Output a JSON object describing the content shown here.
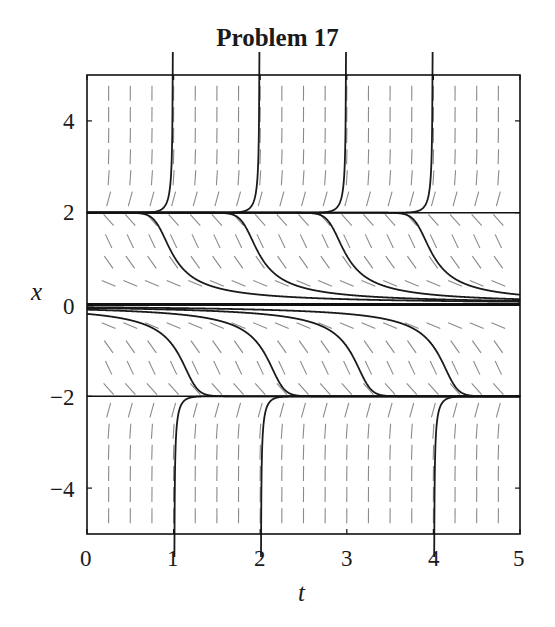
{
  "chart_data": {
    "type": "line",
    "title": "Problem 17",
    "xlabel": "t",
    "ylabel": "x",
    "xlim": [
      0,
      5
    ],
    "ylim": [
      -5,
      5
    ],
    "xticks": [
      0,
      1,
      2,
      3,
      4,
      5
    ],
    "yticks": [
      -4,
      -2,
      0,
      2,
      4
    ],
    "grid": false,
    "legend": null,
    "slope_field": {
      "equation": "dx/dt = x^2 (x^2 - 4)",
      "t_start": 0.25,
      "t_step": 0.25,
      "t_count": 20,
      "x_start": -4.6,
      "x_step": 0.46,
      "x_count": 21,
      "color": "#8a8a8a"
    },
    "equilibria": [
      2,
      0,
      -2
    ],
    "series": [
      {
        "name": "blowup-1",
        "points": [
          [
            0.0,
            2.0
          ],
          [
            0.5,
            2.01
          ],
          [
            0.8,
            2.1
          ],
          [
            0.95,
            2.6
          ],
          [
            1.0,
            5.0
          ]
        ]
      },
      {
        "name": "blowup-2",
        "points": [
          [
            1.0,
            2.0
          ],
          [
            1.5,
            2.01
          ],
          [
            1.8,
            2.1
          ],
          [
            1.95,
            2.6
          ],
          [
            2.0,
            5.0
          ]
        ]
      },
      {
        "name": "blowup-3",
        "points": [
          [
            2.0,
            2.0
          ],
          [
            2.5,
            2.01
          ],
          [
            2.8,
            2.1
          ],
          [
            2.95,
            2.6
          ],
          [
            3.0,
            5.0
          ]
        ]
      },
      {
        "name": "blowup-4",
        "points": [
          [
            3.0,
            2.0
          ],
          [
            3.5,
            2.01
          ],
          [
            3.8,
            2.1
          ],
          [
            3.95,
            2.6
          ],
          [
            4.0,
            5.0
          ]
        ]
      },
      {
        "name": "upper-1",
        "points": [
          [
            0.5,
            2.0
          ],
          [
            0.7,
            1.9
          ],
          [
            0.9,
            1.3
          ],
          [
            1.1,
            0.8
          ],
          [
            1.5,
            0.5
          ],
          [
            2.5,
            0.3
          ],
          [
            5.0,
            0.15
          ]
        ]
      },
      {
        "name": "upper-2",
        "points": [
          [
            1.5,
            2.0
          ],
          [
            1.7,
            1.9
          ],
          [
            1.9,
            1.3
          ],
          [
            2.1,
            0.8
          ],
          [
            2.5,
            0.5
          ],
          [
            3.5,
            0.3
          ],
          [
            5.0,
            0.18
          ]
        ]
      },
      {
        "name": "upper-3",
        "points": [
          [
            2.5,
            2.0
          ],
          [
            2.7,
            1.9
          ],
          [
            2.9,
            1.3
          ],
          [
            3.1,
            0.8
          ],
          [
            3.5,
            0.5
          ],
          [
            4.5,
            0.3
          ],
          [
            5.0,
            0.25
          ]
        ]
      },
      {
        "name": "upper-4",
        "points": [
          [
            3.5,
            2.0
          ],
          [
            3.7,
            1.9
          ],
          [
            3.9,
            1.3
          ],
          [
            4.1,
            0.8
          ],
          [
            4.5,
            0.5
          ],
          [
            5.0,
            0.35
          ]
        ]
      },
      {
        "name": "lower-1",
        "points": [
          [
            0.0,
            -0.2
          ],
          [
            0.5,
            -0.3
          ],
          [
            0.9,
            -0.8
          ],
          [
            1.1,
            -1.4
          ],
          [
            1.3,
            -1.95
          ],
          [
            1.5,
            -2.0
          ]
        ]
      },
      {
        "name": "lower-2",
        "points": [
          [
            0.0,
            -0.1
          ],
          [
            1.3,
            -0.3
          ],
          [
            1.9,
            -0.8
          ],
          [
            2.1,
            -1.4
          ],
          [
            2.3,
            -1.95
          ],
          [
            2.5,
            -2.0
          ]
        ]
      },
      {
        "name": "lower-3",
        "points": [
          [
            0.0,
            -0.07
          ],
          [
            2.3,
            -0.3
          ],
          [
            2.9,
            -0.8
          ],
          [
            3.1,
            -1.4
          ],
          [
            3.3,
            -1.95
          ],
          [
            3.5,
            -2.0
          ]
        ]
      },
      {
        "name": "lower-4",
        "points": [
          [
            0.0,
            -0.05
          ],
          [
            3.3,
            -0.3
          ],
          [
            3.9,
            -0.8
          ],
          [
            4.1,
            -1.4
          ],
          [
            4.3,
            -1.95
          ],
          [
            4.5,
            -2.0
          ]
        ]
      },
      {
        "name": "bottom-1",
        "points": [
          [
            1.0,
            -5.0
          ],
          [
            1.05,
            -2.6
          ],
          [
            1.2,
            -2.1
          ],
          [
            1.5,
            -2.01
          ],
          [
            2.0,
            -2.0
          ]
        ]
      },
      {
        "name": "bottom-2",
        "points": [
          [
            2.0,
            -5.0
          ],
          [
            2.05,
            -2.6
          ],
          [
            2.2,
            -2.1
          ],
          [
            2.5,
            -2.01
          ],
          [
            3.0,
            -2.0
          ]
        ]
      },
      {
        "name": "bottom-3",
        "points": [
          [
            4.0,
            -5.0
          ],
          [
            4.05,
            -2.6
          ],
          [
            4.2,
            -2.1
          ],
          [
            4.5,
            -2.01
          ],
          [
            5.0,
            -2.0
          ]
        ]
      }
    ],
    "curve_initial_conditions": {
      "blowup_t": [
        1,
        2,
        3,
        4
      ],
      "upper_x5_targets": [
        0.6,
        1.6,
        2.6,
        3.6
      ],
      "lower_cross_t": [
        1.0,
        2.0,
        3.0,
        4.0
      ],
      "bottom_t": [
        1,
        2,
        4
      ]
    }
  },
  "labels": {
    "title": "Problem 17",
    "xlabel": "t",
    "ylabel": "x",
    "xtick_labels": [
      "0",
      "1",
      "2",
      "3",
      "4",
      "5"
    ],
    "ytick_labels": [
      "4",
      "2",
      "0",
      "−2",
      "−4"
    ]
  }
}
